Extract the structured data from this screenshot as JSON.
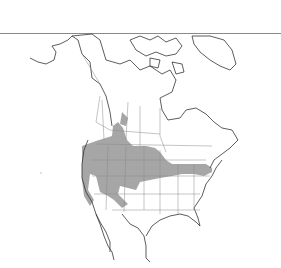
{
  "map": {
    "subject": "North America species range map",
    "colors": {
      "background": "#ffffff",
      "outline": "#333333",
      "border": "#888888",
      "range_fill": "#a6a6a6",
      "top_rule": "#8a8a8a"
    },
    "regions": [
      "Alaska",
      "Canada",
      "Greenland",
      "United States",
      "Mexico"
    ],
    "range_label": "Shaded range"
  }
}
